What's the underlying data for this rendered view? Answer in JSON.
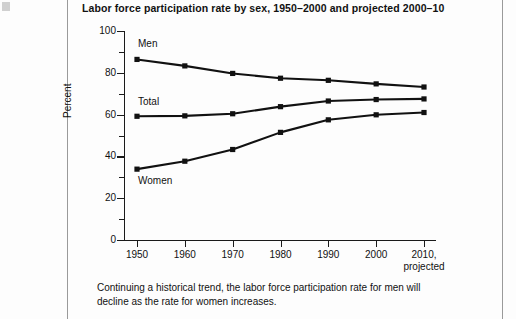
{
  "chart": {
    "title": "Labor force participation rate by sex, 1950–2000 and projected 2000–10",
    "ylabel": "Percent",
    "xlabel": "",
    "x_tick_sub_note": "projected",
    "series_labels": {
      "men": "Men",
      "total": "Total",
      "women": "Women"
    },
    "y_ticks": [
      "0",
      "20",
      "40",
      "60",
      "80",
      "100"
    ],
    "x_ticks": [
      "1950",
      "1960",
      "1970",
      "1980",
      "1990",
      "2000",
      "2010,"
    ]
  },
  "caption": "Continuing a historical trend, the labor force participation rate for men will decline as the rate for women increases.",
  "colors": {
    "line": "#111111",
    "axis": "#1a1a1a",
    "page_rule": "#9a9a9a",
    "background": "#fdfdfd"
  },
  "chart_data": {
    "type": "line",
    "title": "Labor force participation rate by sex, 1950–2000 and projected 2000–10",
    "xlabel": "",
    "ylabel": "Percent",
    "x": [
      1950,
      1960,
      1970,
      1980,
      1990,
      2000,
      2010
    ],
    "xtick_labels": [
      "1950",
      "1960",
      "1970",
      "1980",
      "1990",
      "2000",
      "2010, projected"
    ],
    "ylim": [
      0,
      100
    ],
    "yticks": [
      0,
      20,
      40,
      60,
      80,
      100
    ],
    "yticks_minor": [
      10,
      30,
      50,
      70,
      90
    ],
    "grid": false,
    "legend": "inline-labels",
    "markers": "square",
    "series": [
      {
        "name": "Men",
        "values": [
          86.4,
          83.3,
          79.7,
          77.4,
          76.4,
          74.7,
          73.2
        ]
      },
      {
        "name": "Total",
        "values": [
          59.2,
          59.4,
          60.4,
          63.8,
          66.5,
          67.2,
          67.5
        ]
      },
      {
        "name": "Women",
        "values": [
          33.9,
          37.7,
          43.3,
          51.5,
          57.5,
          59.9,
          61.0
        ]
      }
    ],
    "annotations": [
      {
        "text": "Men",
        "x": 1951.5,
        "y": 93
      },
      {
        "text": "Total",
        "x": 1951.5,
        "y": 69
      },
      {
        "text": "Women",
        "x": 1951.5,
        "y": 26
      }
    ]
  }
}
